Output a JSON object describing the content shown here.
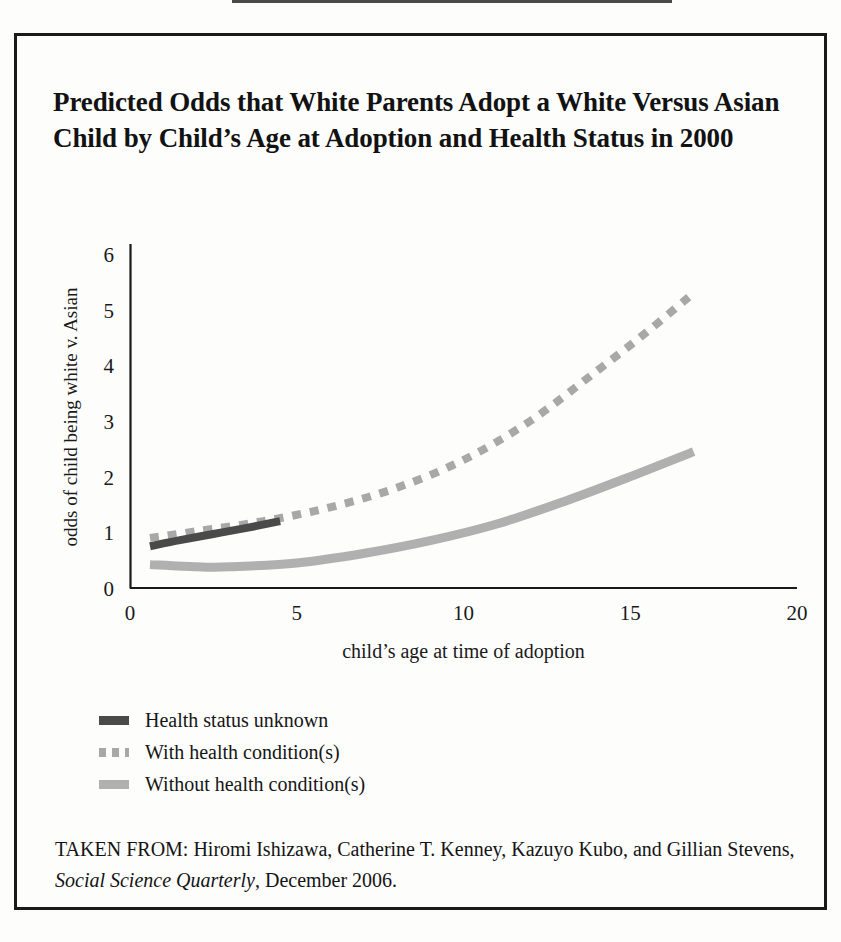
{
  "figure": {
    "title": "Predicted Odds that White Parents Adopt a White Versus Asian Child by Child’s Age at Adoption and Health Status in 2000",
    "source_prefix": "TAKEN FROM: Hiromi Ishizawa, Catherine T. Kenney, Kazuyo Kubo, and Gillian Stevens, ",
    "source_italic": "Social Science Quarterly",
    "source_suffix": ", December 2006.",
    "border_color": "#1a1a1a"
  },
  "legend": {
    "items": [
      {
        "label": "Health status unknown",
        "style": "solid",
        "color": "#4a4a4a"
      },
      {
        "label": "With health condition(s)",
        "style": "dashed",
        "color": "#a8a8a8"
      },
      {
        "label": "Without health condition(s)",
        "style": "solid",
        "color": "#b0b0b0"
      }
    ]
  },
  "chart_data": {
    "type": "line",
    "title": "Predicted Odds that White Parents Adopt a White Versus Asian Child by Child’s Age at Adoption and Health Status in 2000",
    "xlabel": "child’s age at time of adoption",
    "ylabel": "odds of child being white v. Asian",
    "xlim": [
      0,
      20
    ],
    "ylim": [
      0,
      6
    ],
    "xticks": [
      0,
      5,
      10,
      15,
      20
    ],
    "yticks": [
      0,
      1,
      2,
      3,
      4,
      5,
      6
    ],
    "xticklabels": [
      "0",
      "5",
      "10",
      "15",
      "20"
    ],
    "yticklabels": [
      "0",
      "1",
      "2",
      "3",
      "4",
      "5",
      "6"
    ],
    "grid": false,
    "legend_position": "below-plot",
    "series": [
      {
        "name": "Health status unknown",
        "style": "solid",
        "color": "#4a4a4a",
        "x": [
          0.6,
          1.5,
          2.5,
          3.5,
          4.5
        ],
        "y": [
          0.75,
          0.86,
          0.97,
          1.08,
          1.2
        ]
      },
      {
        "name": "With health condition(s)",
        "style": "dashed",
        "color": "#a8a8a8",
        "x": [
          0.6,
          2.0,
          4.0,
          6.0,
          8.0,
          10.0,
          12.0,
          14.0,
          15.5,
          16.9
        ],
        "y": [
          0.9,
          1.02,
          1.2,
          1.45,
          1.8,
          2.3,
          3.0,
          3.9,
          4.6,
          5.3
        ]
      },
      {
        "name": "Without health condition(s)",
        "style": "solid",
        "color": "#b0b0b0",
        "x": [
          0.6,
          2.0,
          3.0,
          5.0,
          7.0,
          9.0,
          11.0,
          13.0,
          15.0,
          16.9
        ],
        "y": [
          0.42,
          0.38,
          0.38,
          0.45,
          0.62,
          0.85,
          1.15,
          1.55,
          2.0,
          2.45
        ]
      }
    ]
  }
}
